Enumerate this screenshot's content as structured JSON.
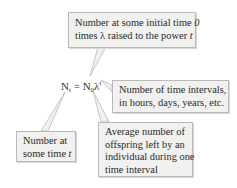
{
  "equation": {
    "lhs_base": "N",
    "lhs_sub": "t",
    "equals": "=",
    "rhs_base": "N",
    "rhs_sub": "0",
    "rhs_lambda": "λ",
    "rhs_sup": "t"
  },
  "callouts": {
    "initial": {
      "line1_pre": "Number at some initial time ",
      "line1_var": "0",
      "line2_pre": "times λ raised to the power ",
      "line2_var": "t"
    },
    "intervals": {
      "line1": "Number of time intervals,",
      "line2": "in hours, days, years, etc."
    },
    "number_at_t": {
      "line1": "Number at",
      "line2_pre": "some time ",
      "line2_var": "t"
    },
    "offspring": {
      "line1": "Average number of",
      "line2": "offspring left by an",
      "line3": "individual during one",
      "line4": "time interval"
    }
  },
  "colors": {
    "callout_fill": "#f1f1f0",
    "callout_border": "#b9b9b9",
    "text": "#2a2a2a"
  }
}
